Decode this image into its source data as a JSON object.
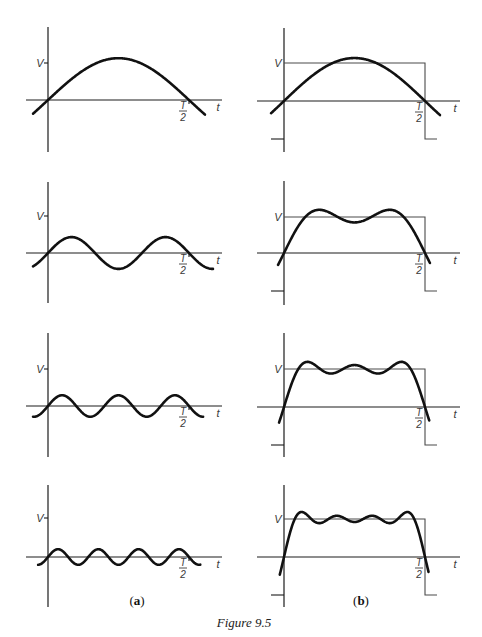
{
  "figure": {
    "caption": "Figure 9.5",
    "column_labels": {
      "a": {
        "open": "(",
        "letter": "a",
        "close": ")"
      },
      "b": {
        "open": "(",
        "letter": "b",
        "close": ")"
      }
    },
    "axis_labels": {
      "voltage": "V",
      "time": "t",
      "half_period_numerator": "T",
      "half_period_denominator": "2"
    }
  },
  "chart_data": [
    {
      "panel": "a1",
      "type": "line",
      "column": "a",
      "row": 1,
      "xlabel": "t",
      "ylabel": "V",
      "xticks": [
        "T/2"
      ],
      "yticks": [
        "V"
      ],
      "series": [
        {
          "name": "fundamental (n=1)",
          "harmonics": [
            1
          ],
          "amplitudes": [
            1.13
          ]
        }
      ],
      "t_range": [
        -0.106,
        1.113
      ]
    },
    {
      "panel": "a2",
      "type": "line",
      "column": "a",
      "row": 2,
      "xlabel": "t",
      "ylabel": "V",
      "xticks": [
        "T/2"
      ],
      "yticks": [
        "V"
      ],
      "series": [
        {
          "name": "3rd harmonic (n=3)",
          "harmonics": [
            3
          ],
          "amplitudes": [
            0.43
          ]
        }
      ],
      "t_range": [
        -0.106,
        1.17
      ]
    },
    {
      "panel": "a3",
      "type": "line",
      "column": "a",
      "row": 3,
      "xlabel": "t",
      "ylabel": "V",
      "xticks": [
        "T/2"
      ],
      "yticks": [
        "V"
      ],
      "series": [
        {
          "name": "5th harmonic (n=5)",
          "harmonics": [
            5
          ],
          "amplitudes": [
            0.29
          ]
        }
      ],
      "t_range": [
        -0.106,
        1.1
      ]
    },
    {
      "panel": "a4",
      "type": "line",
      "column": "a",
      "row": 4,
      "xlabel": "t",
      "ylabel": "V",
      "xticks": [
        "T/2"
      ],
      "yticks": [
        "V"
      ],
      "series": [
        {
          "name": "7th harmonic (n=7)",
          "harmonics": [
            7
          ],
          "amplitudes": [
            0.2
          ]
        }
      ],
      "t_range": [
        -0.07,
        1.08
      ]
    },
    {
      "panel": "b1",
      "type": "line",
      "column": "b",
      "row": 1,
      "xlabel": "t",
      "ylabel": "V",
      "xticks": [
        "T/2"
      ],
      "yticks": [
        "V",
        "-V"
      ],
      "series": [
        {
          "name": "square wave",
          "levels": [
            1,
            -1
          ],
          "switch_at": "T/2"
        },
        {
          "name": "partial sum n=1",
          "harmonics": [
            1
          ],
          "amplitudes": [
            1.13
          ]
        }
      ],
      "t_range": [
        -0.092,
        1.106
      ]
    },
    {
      "panel": "b2",
      "type": "line",
      "column": "b",
      "row": 2,
      "xlabel": "t",
      "ylabel": "V",
      "xticks": [
        "T/2"
      ],
      "yticks": [
        "V",
        "-V"
      ],
      "series": [
        {
          "name": "square wave",
          "levels": [
            1,
            -1
          ],
          "switch_at": "T/2"
        },
        {
          "name": "partial sum n=1,3",
          "harmonics": [
            1,
            3
          ],
          "amplitudes": [
            1.273,
            0.424
          ]
        }
      ],
      "t_range": [
        -0.042,
        1.035
      ]
    },
    {
      "panel": "b3",
      "type": "line",
      "column": "b",
      "row": 3,
      "xlabel": "t",
      "ylabel": "V",
      "xticks": [
        "T/2"
      ],
      "yticks": [
        "V",
        "-V"
      ],
      "series": [
        {
          "name": "square wave",
          "levels": [
            1,
            -1
          ],
          "switch_at": "T/2"
        },
        {
          "name": "partial sum n=1,3,5",
          "harmonics": [
            1,
            3,
            5
          ],
          "amplitudes": [
            1.273,
            0.424,
            0.255
          ]
        }
      ],
      "t_range": [
        -0.035,
        1.03
      ]
    },
    {
      "panel": "b4",
      "type": "line",
      "column": "b",
      "row": 4,
      "xlabel": "t",
      "ylabel": "V",
      "xticks": [
        "T/2"
      ],
      "yticks": [
        "V",
        "-V"
      ],
      "series": [
        {
          "name": "square wave",
          "levels": [
            1,
            -1
          ],
          "switch_at": "T/2"
        },
        {
          "name": "partial sum n=1,3,5,7",
          "harmonics": [
            1,
            3,
            5,
            7
          ],
          "amplitudes": [
            1.273,
            0.424,
            0.255,
            0.182
          ]
        }
      ],
      "t_range": [
        -0.03,
        1.025
      ]
    }
  ]
}
